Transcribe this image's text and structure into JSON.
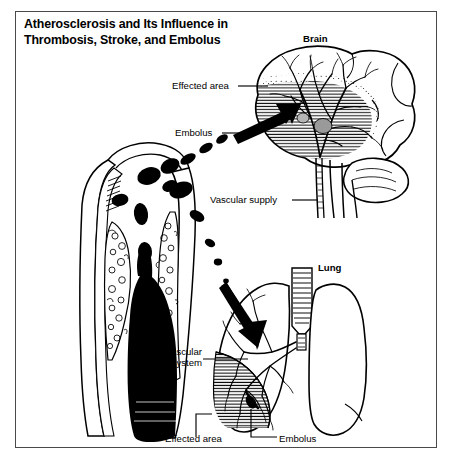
{
  "figure": {
    "title_line_1": "Atherosclerosis and Its Influence in",
    "title_line_2": "Thrombosis, Stroke, and Embolus",
    "title_full": "Atherosclerosis and Its Influence in Thrombosis, Stroke, and Embolus",
    "frame_color": "#4a4a4a",
    "background_color": "#ffffff",
    "ink_color": "#000000"
  },
  "labels": {
    "brain": "Brain",
    "lung": "Lung",
    "effected_area_brain": "Effected area",
    "embolus_brain": "Embolus",
    "vascular_supply": "Vascular supply",
    "vascular_system_line_1": "Vascular",
    "vascular_system_line_2": "system",
    "effected_area_lung": "Effected area",
    "embolus_lung": "Embolus"
  },
  "diagram": {
    "parts": [
      "artery-cross-section",
      "atherosclerotic-plaque",
      "thrombus",
      "embolus-trail-upper",
      "embolus-trail-lower",
      "brain",
      "cerebellum",
      "brainstem",
      "brain-vasculature",
      "carotid-vessels",
      "lung-left",
      "lung-right",
      "trachea",
      "pulmonary-vasculature",
      "infarct-wedge"
    ],
    "arrows": [
      {
        "name": "arrow-to-brain",
        "target": "brain effected area"
      },
      {
        "name": "arrow-to-lung",
        "target": "lung effected area"
      }
    ]
  }
}
